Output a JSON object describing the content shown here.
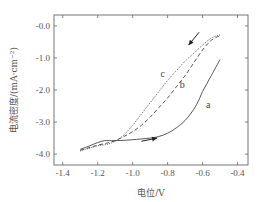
{
  "chart_data": {
    "type": "line",
    "title": "",
    "xlabel": "电位/V",
    "ylabel": "电流密度/(mA·cm⁻²)",
    "xlim": [
      -1.45,
      -0.34
    ],
    "ylim": [
      -4.34,
      0.34
    ],
    "xticks": [
      -1.4,
      -1.2,
      -1.0,
      -0.8,
      -0.6,
      -0.4
    ],
    "xtick_labels": [
      "-1.4",
      "-1.2",
      "-1.0",
      "-0.8",
      "-0.6",
      "-0.4"
    ],
    "yticks": [
      0.0,
      -1.0,
      -2.0,
      -3.0,
      -4.0
    ],
    "ytick_labels": [
      "-0.0",
      "-1.0",
      "-2.0",
      "-3.0",
      "-4.0"
    ],
    "grid": false,
    "legend": "none",
    "series": [
      {
        "name": "a",
        "style": "solid",
        "x": [
          -1.3,
          -1.25,
          -1.2,
          -1.16,
          -1.12,
          -1.05,
          -1.0,
          -0.9,
          -0.85,
          -0.8,
          -0.75,
          -0.7,
          -0.65,
          -0.62,
          -0.6,
          -0.55,
          -0.5
        ],
        "y": [
          -3.85,
          -3.75,
          -3.64,
          -3.58,
          -3.58,
          -3.57,
          -3.55,
          -3.5,
          -3.45,
          -3.35,
          -3.18,
          -2.95,
          -2.6,
          -2.3,
          -2.05,
          -1.55,
          -1.05
        ]
      },
      {
        "name": "b",
        "style": "dashed",
        "x": [
          -1.3,
          -1.25,
          -1.2,
          -1.15,
          -1.1,
          -1.05,
          -1.0,
          -0.95,
          -0.9,
          -0.85,
          -0.8,
          -0.75,
          -0.7,
          -0.65,
          -0.6,
          -0.55,
          -0.5
        ],
        "y": [
          -3.88,
          -3.8,
          -3.72,
          -3.66,
          -3.58,
          -3.45,
          -3.3,
          -3.1,
          -2.85,
          -2.55,
          -2.25,
          -1.9,
          -1.55,
          -1.15,
          -0.75,
          -0.45,
          -0.3
        ]
      },
      {
        "name": "c",
        "style": "dotted",
        "x": [
          -1.3,
          -1.25,
          -1.2,
          -1.15,
          -1.1,
          -1.05,
          -1.0,
          -0.95,
          -0.9,
          -0.85,
          -0.8,
          -0.75,
          -0.7,
          -0.65,
          -0.6,
          -0.55,
          -0.5
        ],
        "y": [
          -3.9,
          -3.82,
          -3.74,
          -3.7,
          -3.6,
          -3.4,
          -3.1,
          -2.75,
          -2.4,
          -2.05,
          -1.7,
          -1.4,
          -1.1,
          -0.85,
          -0.6,
          -0.38,
          -0.28
        ]
      }
    ],
    "annotations": [
      {
        "text": "a",
        "x": -0.58,
        "y": -2.55
      },
      {
        "text": "b",
        "x": -0.73,
        "y": -1.95
      },
      {
        "text": "c",
        "x": -0.84,
        "y": -1.6
      }
    ],
    "arrows": [
      {
        "name": "forward-scan-arrow",
        "direction": "right",
        "from": [
          -0.95,
          -3.6
        ],
        "to": [
          -0.86,
          -3.5
        ]
      },
      {
        "name": "reverse-scan-arrow",
        "direction": "down-left",
        "from": [
          -0.62,
          -0.2
        ],
        "to": [
          -0.68,
          -0.6
        ]
      }
    ]
  }
}
